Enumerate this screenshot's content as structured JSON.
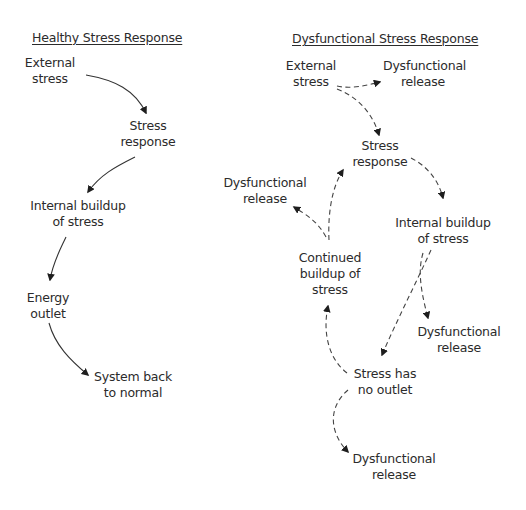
{
  "healthy": {
    "title": "Healthy Stress Response",
    "nodes": [
      {
        "id": "external_stress",
        "label": "External\nstress"
      },
      {
        "id": "stress_response",
        "label": "Stress\nresponse"
      },
      {
        "id": "internal_buildup",
        "label": "Internal buildup\nof stress"
      },
      {
        "id": "energy_outlet",
        "label": "Energy\noutlet"
      },
      {
        "id": "system_back",
        "label": "System back\nto normal"
      }
    ],
    "edges": [
      {
        "from": "external_stress",
        "to": "stress_response",
        "style": "solid"
      },
      {
        "from": "stress_response",
        "to": "internal_buildup",
        "style": "solid"
      },
      {
        "from": "internal_buildup",
        "to": "energy_outlet",
        "style": "solid"
      },
      {
        "from": "energy_outlet",
        "to": "system_back",
        "style": "solid"
      }
    ]
  },
  "dysfunctional": {
    "title": "Dysfunctional Stress Response",
    "nodes": [
      {
        "id": "external_stress",
        "label": "External\nstress"
      },
      {
        "id": "release_1",
        "label": "Dysfunctional\nrelease"
      },
      {
        "id": "stress_response",
        "label": "Stress\nresponse"
      },
      {
        "id": "release_2",
        "label": "Dysfunctional\nrelease"
      },
      {
        "id": "internal_buildup",
        "label": "Internal buildup\nof stress"
      },
      {
        "id": "continued_buildup",
        "label": "Continued\nbuildup of\nstress"
      },
      {
        "id": "release_3",
        "label": "Dysfunctional\nrelease"
      },
      {
        "id": "no_outlet",
        "label": "Stress has\nno outlet"
      },
      {
        "id": "release_4",
        "label": "Dysfunctional\nrelease"
      }
    ],
    "edges": [
      {
        "from": "external_stress",
        "to": "release_1",
        "style": "dashed"
      },
      {
        "from": "external_stress",
        "to": "stress_response",
        "style": "dashed"
      },
      {
        "from": "stress_response",
        "to": "internal_buildup",
        "style": "dashed"
      },
      {
        "from": "internal_buildup",
        "to": "release_3",
        "style": "dashed"
      },
      {
        "from": "internal_buildup",
        "to": "no_outlet",
        "style": "dashed"
      },
      {
        "from": "no_outlet",
        "to": "continued_buildup",
        "style": "dashed"
      },
      {
        "from": "no_outlet",
        "to": "release_4",
        "style": "dashed"
      },
      {
        "from": "continued_buildup",
        "to": "stress_response",
        "style": "dashed"
      },
      {
        "from": "continued_buildup",
        "to": "release_2",
        "style": "dashed"
      }
    ]
  }
}
